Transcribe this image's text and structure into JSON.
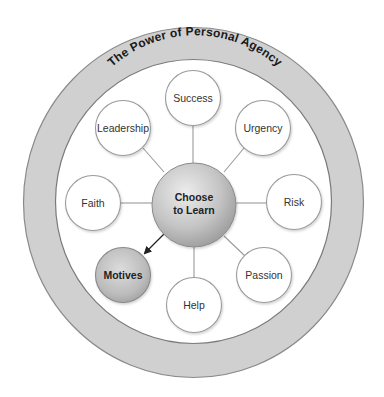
{
  "title": "The Power of Personal Agency",
  "center": {
    "line1": "Choose",
    "line2": "to Learn"
  },
  "nodes": [
    {
      "label": "Success"
    },
    {
      "label": "Urgency"
    },
    {
      "label": "Risk"
    },
    {
      "label": "Passion"
    },
    {
      "label": "Help"
    },
    {
      "label": "Motives"
    },
    {
      "label": "Faith"
    },
    {
      "label": "Leadership"
    }
  ],
  "colors": {
    "ring_fill": "#d0d0d0",
    "ring_stroke": "#8a8a8a",
    "node_fill": "#ffffff",
    "node_stroke": "#9a9a9a",
    "center_light": "#e8e8e8",
    "center_dark": "#9c9c9c",
    "connector": "#9a9a9a",
    "arrow": "#222222"
  }
}
